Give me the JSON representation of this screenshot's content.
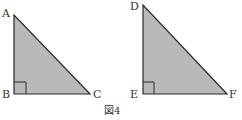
{
  "figure": {
    "caption": "図4",
    "fill_color": "#b9b9b9",
    "stroke_color": "#2a2a2a",
    "triangles": [
      {
        "name": "ABC",
        "right_angle_at": "B",
        "vertices": [
          {
            "label": "A",
            "x": 14,
            "y": 15
          },
          {
            "label": "B",
            "x": 14,
            "y": 94
          },
          {
            "label": "C",
            "x": 90,
            "y": 94
          }
        ]
      },
      {
        "name": "DEF",
        "right_angle_at": "E",
        "vertices": [
          {
            "label": "D",
            "x": 143,
            "y": 5
          },
          {
            "label": "E",
            "x": 143,
            "y": 94
          },
          {
            "label": "F",
            "x": 227,
            "y": 94
          }
        ]
      }
    ]
  }
}
